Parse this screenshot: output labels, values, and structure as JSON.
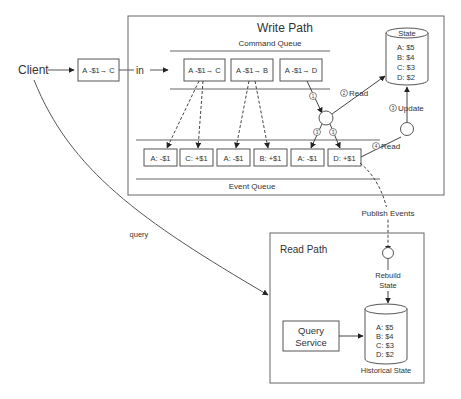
{
  "client": {
    "label": "Client",
    "message": "A -$1→ C",
    "in_label": "in",
    "query_label": "query"
  },
  "write_path": {
    "title": "Write Path",
    "command_queue": {
      "label": "Command Queue",
      "commands": [
        "A -$1→ C",
        "A -$1→ B",
        "A -$1→ D"
      ]
    },
    "event_queue": {
      "label": "Event Queue",
      "events": [
        "A: -$1",
        "C: +$1",
        "A: -$1",
        "B: +$1",
        "A: -$1",
        "D: +$1"
      ]
    },
    "steps": {
      "s1": "1",
      "s2": "2",
      "s2_label": "Read",
      "s3": "3",
      "s3_label": "Update",
      "s4": "4",
      "s4_label": "Read"
    },
    "state": {
      "title": "State",
      "values": [
        "A:  $5",
        "B:  $4",
        "C:  $3",
        "D:  $2"
      ]
    }
  },
  "publish_events": "Publish Events",
  "read_path": {
    "title": "Read Path",
    "rebuild": [
      "Rebuild",
      "State"
    ],
    "query_service": [
      "Query",
      "Service"
    ],
    "historical_state": {
      "title": "Historical State",
      "values": [
        "A:  $5",
        "B:  $4",
        "C:  $3",
        "D:  $2"
      ]
    }
  }
}
